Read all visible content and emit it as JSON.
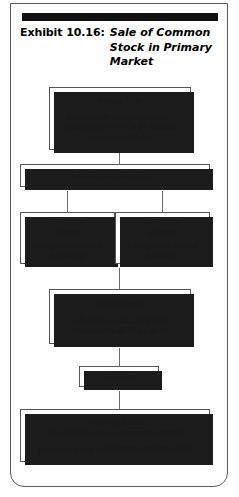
{
  "exhibit": {
    "label": "Exhibit 10.16:",
    "title": "Sale of Common Stock in Primary Market"
  },
  "flow": {
    "issuing_firm": {
      "title": "Issuing Firm",
      "detail_line1": "(firm needs $9.5 million of capital;",
      "detail_line2": "sells 1 million shares at $9.50 net to",
      "detail_line3": "investment bankers)"
    },
    "lead_investment_banker": {
      "title": "Lead Investment Banker"
    },
    "syndicate_member_left": {
      "title_line1": "Syndicate",
      "title_line2": "Member",
      "detail_line1": "(takes pro rata position",
      "detail_line2": "in offering)"
    },
    "syndicate_member_right": {
      "title_line1": "Syndicate",
      "title_line2": "Member",
      "detail_line1": "(takes pro rata position",
      "detail_line2": "in offering)"
    },
    "selling_group": {
      "title": "Selling Group",
      "detail_line1": "(sells stock to public for $10.00;",
      "detail_line2": "commission is $0.50 per share)"
    },
    "brokers": {
      "title": "Brokers"
    },
    "investing_public": {
      "title": "Investing Public",
      "detail_line1": "(pays $10.00 per share in primary offering)",
      "detail_line2": "underwriting costs = $500,000/$9,500,000 = 5.3%"
    }
  },
  "colors": {
    "ink": "#1a1a1a",
    "rule": "#111111",
    "box_border": "#555555",
    "shadow": "#1c1c1c",
    "connector": "#6b6b6b",
    "frame": "#5a5a5a"
  }
}
